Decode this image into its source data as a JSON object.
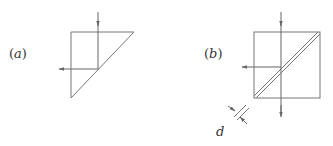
{
  "figure": {
    "panels": [
      {
        "id": "a",
        "label": "(a)",
        "label_letter": "a",
        "element": "right-angle prism (half cube)",
        "incident_ray": "downward vertical",
        "reflected_ray": "leftward horizontal"
      },
      {
        "id": "b",
        "label": "(b)",
        "label_letter": "b",
        "element": "cube beam splitter with thin gap along diagonal",
        "incident_ray": "downward vertical",
        "transmitted_ray": "downward vertical (continues through)",
        "reflected_ray": "leftward horizontal",
        "gap_label": "d"
      }
    ],
    "colors": {
      "line": "#777777",
      "ray": "#666666",
      "text": "#333333",
      "background": "#ffffff"
    }
  }
}
